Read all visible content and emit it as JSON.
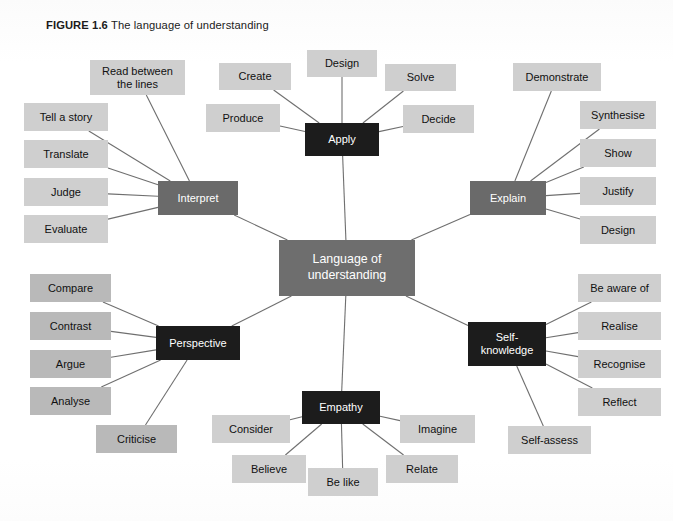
{
  "figure": {
    "label": "FIGURE 1.6",
    "title": "The language of understanding",
    "background_color": "#ffffff"
  },
  "colors": {
    "center_node": "#6e6e6e",
    "branch_gray": "#6a6a6a",
    "branch_dark": "#1c1c1c",
    "leaf_light": "#cfcfcf",
    "leaf_dim": "#b9b9b9",
    "edge_line": "#6f6f6f",
    "branch_text": "#ffffff",
    "leaf_text": "#111111"
  },
  "diagram": {
    "type": "mind-map",
    "center": {
      "label": "Language of\nunderstanding",
      "style": "center",
      "x": 279,
      "y": 240,
      "w": 136,
      "h": 56
    },
    "branches": [
      {
        "id": "apply",
        "label": "Apply",
        "style": "dark",
        "x": 305,
        "y": 123,
        "w": 74,
        "h": 33,
        "leaves": [
          {
            "label": "Create",
            "x": 219,
            "y": 63,
            "w": 72,
            "h": 27
          },
          {
            "label": "Design",
            "x": 307,
            "y": 50,
            "w": 70,
            "h": 27
          },
          {
            "label": "Solve",
            "x": 385,
            "y": 64,
            "w": 71,
            "h": 27
          },
          {
            "label": "Produce",
            "x": 206,
            "y": 104,
            "w": 74,
            "h": 28
          },
          {
            "label": "Decide",
            "x": 403,
            "y": 105,
            "w": 71,
            "h": 28
          }
        ]
      },
      {
        "id": "interpret",
        "label": "Interpret",
        "style": "gray",
        "x": 158,
        "y": 181,
        "w": 80,
        "h": 34,
        "leaves": [
          {
            "label": "Read between\nthe lines",
            "x": 90,
            "y": 60,
            "w": 95,
            "h": 35
          },
          {
            "label": "Tell a story",
            "x": 24,
            "y": 103,
            "w": 84,
            "h": 28
          },
          {
            "label": "Translate",
            "x": 24,
            "y": 140,
            "w": 84,
            "h": 28
          },
          {
            "label": "Judge",
            "x": 24,
            "y": 178,
            "w": 84,
            "h": 28
          },
          {
            "label": "Evaluate",
            "x": 24,
            "y": 215,
            "w": 84,
            "h": 28
          }
        ]
      },
      {
        "id": "explain",
        "label": "Explain",
        "style": "gray",
        "x": 470,
        "y": 181,
        "w": 76,
        "h": 34,
        "leaves": [
          {
            "label": "Demonstrate",
            "x": 513,
            "y": 63,
            "w": 88,
            "h": 28
          },
          {
            "label": "Synthesise",
            "x": 580,
            "y": 101,
            "w": 76,
            "h": 28
          },
          {
            "label": "Show",
            "x": 580,
            "y": 139,
            "w": 76,
            "h": 28
          },
          {
            "label": "Justify",
            "x": 580,
            "y": 177,
            "w": 76,
            "h": 28
          },
          {
            "label": "Design",
            "x": 580,
            "y": 216,
            "w": 76,
            "h": 28
          }
        ]
      },
      {
        "id": "perspective",
        "label": "Perspective",
        "style": "dark",
        "x": 156,
        "y": 326,
        "w": 84,
        "h": 34,
        "leaves": [
          {
            "label": "Compare",
            "x": 30,
            "y": 274,
            "w": 81,
            "h": 28,
            "dim": true
          },
          {
            "label": "Contrast",
            "x": 30,
            "y": 312,
            "w": 81,
            "h": 28,
            "dim": true
          },
          {
            "label": "Argue",
            "x": 30,
            "y": 350,
            "w": 81,
            "h": 28,
            "dim": true
          },
          {
            "label": "Analyse",
            "x": 30,
            "y": 387,
            "w": 81,
            "h": 28,
            "dim": true
          },
          {
            "label": "Criticise",
            "x": 96,
            "y": 425,
            "w": 81,
            "h": 28,
            "dim": true
          }
        ]
      },
      {
        "id": "self-knowledge",
        "label": "Self-\nknowledge",
        "style": "dark",
        "x": 468,
        "y": 322,
        "w": 78,
        "h": 44,
        "leaves": [
          {
            "label": "Be aware of",
            "x": 578,
            "y": 274,
            "w": 83,
            "h": 28
          },
          {
            "label": "Realise",
            "x": 578,
            "y": 312,
            "w": 83,
            "h": 28
          },
          {
            "label": "Recognise",
            "x": 578,
            "y": 350,
            "w": 83,
            "h": 28
          },
          {
            "label": "Reflect",
            "x": 578,
            "y": 388,
            "w": 83,
            "h": 28
          },
          {
            "label": "Self-assess",
            "x": 508,
            "y": 426,
            "w": 83,
            "h": 28
          }
        ]
      },
      {
        "id": "empathy",
        "label": "Empathy",
        "style": "dark",
        "x": 302,
        "y": 391,
        "w": 78,
        "h": 33,
        "leaves": [
          {
            "label": "Consider",
            "x": 212,
            "y": 415,
            "w": 78,
            "h": 28
          },
          {
            "label": "Believe",
            "x": 232,
            "y": 455,
            "w": 74,
            "h": 28
          },
          {
            "label": "Be like",
            "x": 308,
            "y": 468,
            "w": 70,
            "h": 28
          },
          {
            "label": "Relate",
            "x": 386,
            "y": 455,
            "w": 72,
            "h": 28
          },
          {
            "label": "Imagine",
            "x": 400,
            "y": 415,
            "w": 75,
            "h": 28
          }
        ]
      }
    ]
  }
}
